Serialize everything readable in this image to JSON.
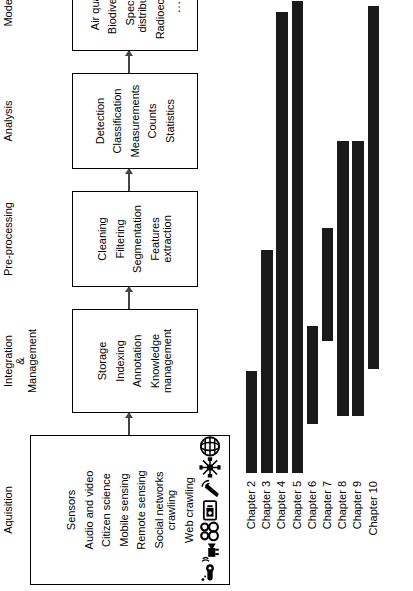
{
  "pipeline": {
    "stages": [
      {
        "id": "acquisition",
        "caption": "Aquisition",
        "items": [
          {
            "label": "Sensors",
            "icon": "sensor-thermometer-icon"
          },
          {
            "label": "Audio and video",
            "icon": "video-camera-icon"
          },
          {
            "label": "Citizen science",
            "icon": "binoculars-icon"
          },
          {
            "label": "Mobile sensing",
            "icon": "smartphone-icon"
          },
          {
            "label": "Remote sensing",
            "icon": "satellite-dish-icon"
          },
          {
            "label": "Social networks\ncrawling",
            "icon": "social-network-icon"
          },
          {
            "label": "Web crawling",
            "icon": "globe-icon"
          }
        ]
      },
      {
        "id": "integration-management",
        "caption": "Integration\n&\nManagement",
        "items": [
          {
            "label": "Storage"
          },
          {
            "label": "Indexing"
          },
          {
            "label": "Annotation"
          },
          {
            "label": "Knowledge\nmanagement"
          }
        ]
      },
      {
        "id": "pre-processing",
        "caption": "Pre-processing",
        "items": [
          {
            "label": "Cleaning"
          },
          {
            "label": "Filtering"
          },
          {
            "label": "Segmentation"
          },
          {
            "label": "Features\nextraction"
          }
        ]
      },
      {
        "id": "analysis",
        "caption": "Analysis",
        "items": [
          {
            "label": "Detection"
          },
          {
            "label": "Classification"
          },
          {
            "label": "Measurements"
          },
          {
            "label": "Counts"
          },
          {
            "label": "Statistics"
          }
        ]
      },
      {
        "id": "modelling",
        "caption": "Modelling",
        "items": [
          {
            "label": "Air quality"
          },
          {
            "label": "Biodiversity"
          },
          {
            "label": "Species\ndistribution"
          },
          {
            "label": "Radioecology"
          },
          {
            "label": "…",
            "kind": "dots"
          }
        ]
      }
    ]
  },
  "chart_data": {
    "type": "bar",
    "orientation": "horizontal",
    "title": "",
    "xlabel": "",
    "ylabel": "",
    "grid": false,
    "legend": null,
    "note": "Horizontal span bars: each chapter covers a contiguous portion of the 5-stage pipeline. Axis units are pipeline-stage positions from 0 (start of Aquisition) to 5 (end of Modelling).",
    "xlim": [
      0,
      5
    ],
    "categories": [
      "Chapter 2",
      "Chapter 3",
      "Chapter 4",
      "Chapter 5",
      "Chapter 6",
      "Chapter 7",
      "Chapter 8",
      "Chapter 9",
      "Chapter 10"
    ],
    "bars": [
      {
        "category": "Chapter 2",
        "start": 0.0,
        "end": 1.08,
        "value": 1.08
      },
      {
        "category": "Chapter 3",
        "start": 0.0,
        "end": 2.36,
        "value": 2.36
      },
      {
        "category": "Chapter 4",
        "start": 0.0,
        "end": 4.88,
        "value": 4.88
      },
      {
        "category": "Chapter 5",
        "start": 0.0,
        "end": 5.0,
        "value": 5.0
      },
      {
        "category": "Chapter 6",
        "start": 0.52,
        "end": 1.56,
        "value": 1.04
      },
      {
        "category": "Chapter 7",
        "start": 1.4,
        "end": 2.6,
        "value": 1.2
      },
      {
        "category": "Chapter 8",
        "start": 0.6,
        "end": 3.52,
        "value": 2.92
      },
      {
        "category": "Chapter 9",
        "start": 0.6,
        "end": 3.52,
        "value": 2.92
      },
      {
        "category": "Chapter 10",
        "start": 1.1,
        "end": 4.95,
        "value": 3.85
      }
    ],
    "bar_color": "#1a1a1a"
  },
  "colors": {
    "bar": "#1a1a1a",
    "box_border": "#000000",
    "background": "#ffffff",
    "connector": "#444444"
  }
}
